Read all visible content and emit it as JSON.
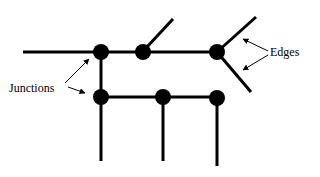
{
  "diagram": {
    "labels": {
      "junctions": "Junctions",
      "edges": "Edges"
    },
    "colors": {
      "line": "#000000",
      "background": "#ffffff"
    },
    "nodes": [
      {
        "id": "j1",
        "x": 101,
        "y": 52
      },
      {
        "id": "j2",
        "x": 143,
        "y": 52
      },
      {
        "id": "j3",
        "x": 217,
        "y": 52
      },
      {
        "id": "j4",
        "x": 101,
        "y": 97
      },
      {
        "id": "j5",
        "x": 163,
        "y": 97
      },
      {
        "id": "j6",
        "x": 217,
        "y": 98
      }
    ]
  }
}
